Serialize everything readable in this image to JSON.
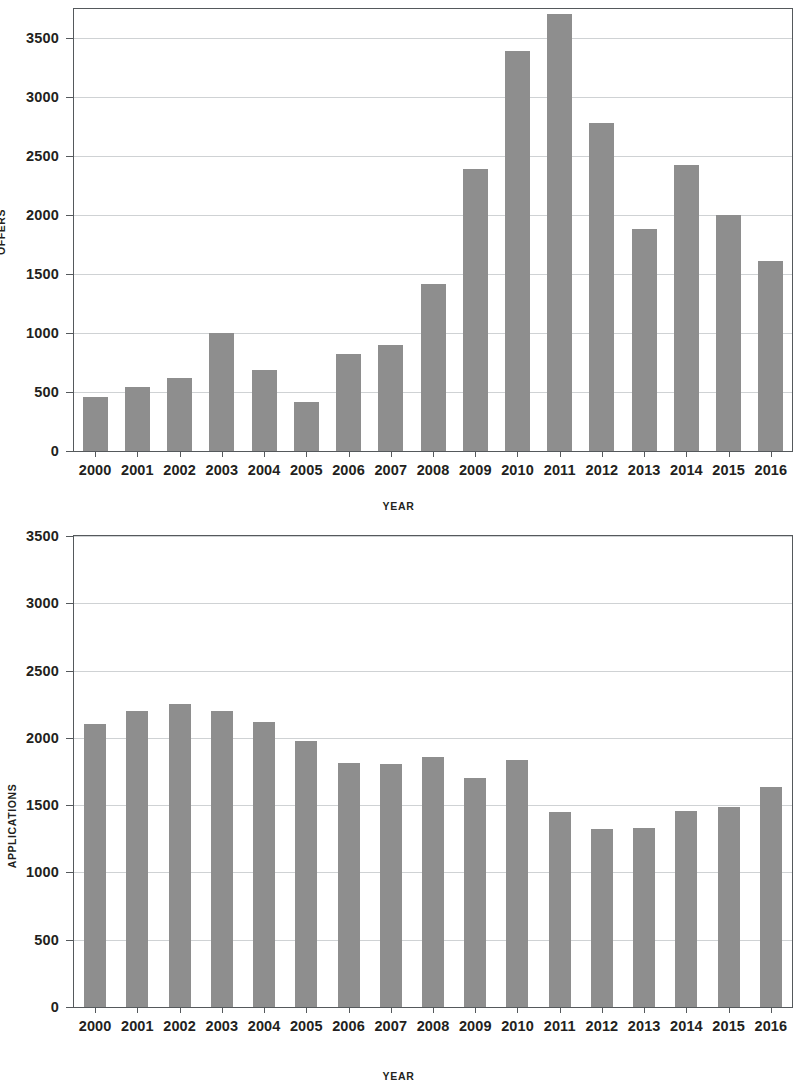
{
  "chart_data": [
    {
      "id": "offers",
      "type": "bar",
      "title": "",
      "xlabel": "YEAR",
      "ylabel": "OFFERS",
      "ylim": [
        0,
        3750
      ],
      "ytick_values": [
        0,
        500,
        1000,
        1500,
        2000,
        2500,
        3000,
        3500
      ],
      "ytick_labels": [
        "0",
        "500",
        "1000",
        "1500",
        "2000",
        "2500",
        "3000",
        "3500"
      ],
      "grid": true,
      "legend": "none",
      "bar_color": "#8e8e8e",
      "categories": [
        "2000",
        "2001",
        "2002",
        "2003",
        "2004",
        "2005",
        "2006",
        "2007",
        "2008",
        "2009",
        "2010",
        "2011",
        "2012",
        "2013",
        "2014",
        "2015",
        "2016"
      ],
      "values": [
        460,
        545,
        620,
        1000,
        690,
        415,
        820,
        900,
        1415,
        2390,
        3390,
        3710,
        2780,
        1885,
        2430,
        2005,
        1610
      ]
    },
    {
      "id": "applications",
      "type": "bar",
      "title": "",
      "xlabel": "YEAR",
      "ylabel": "APPLICATIONS",
      "ylim": [
        0,
        3500
      ],
      "ytick_values": [
        0,
        500,
        1000,
        1500,
        2000,
        2500,
        3000,
        3500
      ],
      "ytick_labels": [
        "0",
        "500",
        "1000",
        "1500",
        "2000",
        "2500",
        "3000",
        "3500"
      ],
      "grid": true,
      "legend": "none",
      "bar_color": "#8e8e8e",
      "categories": [
        "2000",
        "2001",
        "2002",
        "2003",
        "2004",
        "2005",
        "2006",
        "2007",
        "2008",
        "2009",
        "2010",
        "2011",
        "2012",
        "2013",
        "2014",
        "2015",
        "2016"
      ],
      "values": [
        2100,
        2200,
        2250,
        2200,
        2120,
        1975,
        1810,
        1805,
        1855,
        1700,
        1835,
        1450,
        1325,
        1330,
        1455,
        1490,
        1635
      ]
    }
  ],
  "figure": {
    "colors": {
      "bar": "#8e8e8e",
      "axis": "#55595c",
      "grid": "#cfd2d4",
      "text": "#231f20",
      "background": "#ffffff"
    }
  }
}
